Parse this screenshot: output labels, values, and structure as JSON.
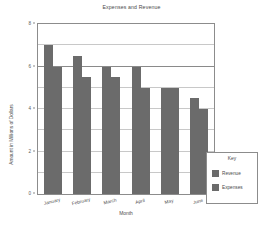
{
  "chart_data": {
    "type": "bar",
    "title": "Expenses and Revenue",
    "xlabel": "Month",
    "ylabel": "Amount in Millions of Dollars",
    "categories": [
      "January",
      "February",
      "March",
      "April",
      "May",
      "June"
    ],
    "series": [
      {
        "name": "Revenue",
        "values": [
          7.0,
          6.5,
          6.0,
          6.0,
          5.0,
          4.5
        ],
        "color": "#6b6b6b"
      },
      {
        "name": "Expenses",
        "values": [
          6.0,
          5.5,
          5.5,
          5.0,
          5.0,
          4.0
        ],
        "color": "#6b6b6b"
      }
    ],
    "ylim": [
      0,
      8
    ],
    "yticks": [
      0,
      2,
      4,
      6,
      8
    ],
    "ytick_labels": [
      "0",
      "2",
      "4",
      "6",
      "8"
    ],
    "gridlines": [
      1,
      2,
      3,
      4,
      5,
      6,
      7
    ],
    "major_gridline": 6,
    "grid": true,
    "legend_position": "lower-right-inside"
  },
  "legend": {
    "title": "Key",
    "entries": [
      {
        "label": "Revenue"
      },
      {
        "label": "Expenses"
      }
    ]
  }
}
